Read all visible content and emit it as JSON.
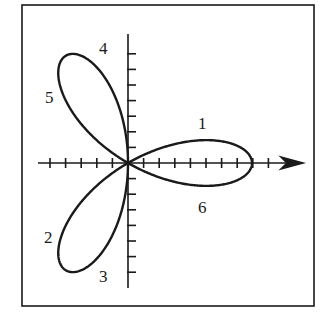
{
  "figure": {
    "type": "polar-rose",
    "frame": {
      "x": 22,
      "y": 5,
      "w": 292,
      "h": 301
    },
    "origin": {
      "x": 128,
      "y": 163
    },
    "tick_spacing_px": 15.6,
    "petal_radius_px": 124,
    "x_axis": {
      "from": 38,
      "to": 303,
      "arrow": true,
      "ticks_left": 5,
      "ticks_right": 9
    },
    "y_axis": {
      "from": 34,
      "to": 288,
      "ticks_up": 7,
      "ticks_down": 7
    },
    "stroke_color": "#1a1a1a"
  },
  "labels": [
    {
      "id": "1",
      "text": "1",
      "x": 198,
      "y": 115
    },
    {
      "id": "2",
      "text": "2",
      "x": 44,
      "y": 229
    },
    {
      "id": "3",
      "text": "3",
      "x": 99,
      "y": 268
    },
    {
      "id": "4",
      "text": "4",
      "x": 99,
      "y": 40
    },
    {
      "id": "5",
      "text": "5",
      "x": 45,
      "y": 89
    },
    {
      "id": "6",
      "text": "6",
      "x": 198,
      "y": 199
    }
  ]
}
